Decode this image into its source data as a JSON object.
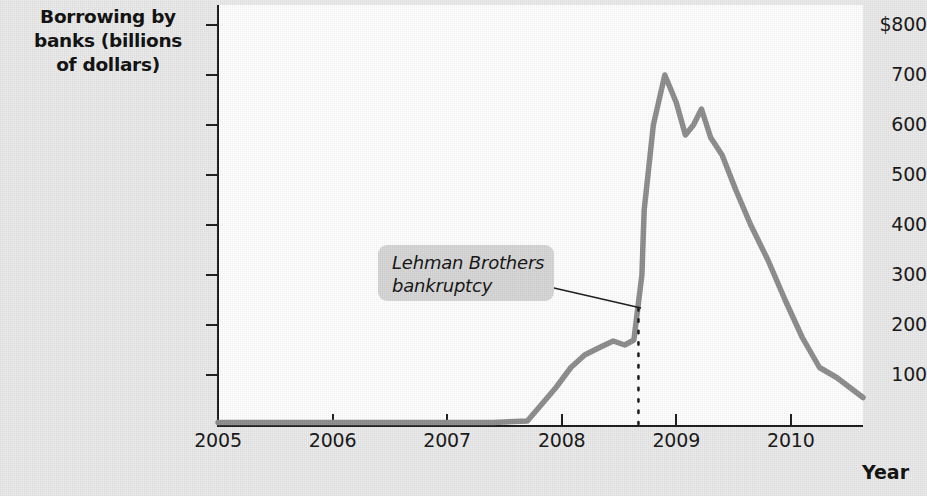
{
  "chart_data": {
    "type": "line",
    "title": "",
    "ylabel": "Borrowing by banks (billions of dollars)",
    "xlabel": "Year",
    "xlim": [
      2005.0,
      2010.63
    ],
    "ylim": [
      0,
      840
    ],
    "grid": false,
    "legend": null,
    "y_ticks": [
      {
        "value": 800,
        "label": "$800"
      },
      {
        "value": 700,
        "label": "700"
      },
      {
        "value": 600,
        "label": "600"
      },
      {
        "value": 500,
        "label": "500"
      },
      {
        "value": 400,
        "label": "400"
      },
      {
        "value": 300,
        "label": "300"
      },
      {
        "value": 200,
        "label": "200"
      },
      {
        "value": 100,
        "label": "100"
      }
    ],
    "x_ticks": [
      {
        "value": 2005,
        "label": "2005"
      },
      {
        "value": 2006,
        "label": "2006"
      },
      {
        "value": 2007,
        "label": "2007"
      },
      {
        "value": 2008,
        "label": "2008"
      },
      {
        "value": 2009,
        "label": "2009"
      },
      {
        "value": 2010,
        "label": "2010"
      }
    ],
    "series": [
      {
        "name": "Borrowing by banks",
        "color": "#8c8c8c",
        "x": [
          2005.0,
          2005.4,
          2005.8,
          2006.2,
          2006.6,
          2007.0,
          2007.4,
          2007.7,
          2007.82,
          2007.95,
          2008.08,
          2008.2,
          2008.33,
          2008.45,
          2008.55,
          2008.63,
          2008.7,
          2008.72,
          2008.8,
          2008.9,
          2009.0,
          2009.08,
          2009.15,
          2009.22,
          2009.3,
          2009.4,
          2009.52,
          2009.65,
          2009.8,
          2009.95,
          2010.1,
          2010.25,
          2010.4,
          2010.63
        ],
        "y": [
          5,
          5,
          5,
          5,
          5,
          5,
          5,
          8,
          40,
          75,
          115,
          140,
          155,
          168,
          160,
          170,
          300,
          430,
          600,
          700,
          645,
          580,
          600,
          632,
          575,
          540,
          470,
          400,
          330,
          250,
          175,
          115,
          95,
          55
        ]
      }
    ],
    "annotations": [
      {
        "name": "lehman-brothers-bankruptcy",
        "text": "Lehman Brothers\nbankruptcy",
        "box": {
          "x": 378,
          "y": 245,
          "w": 176,
          "h": 56,
          "fill": "#d6d6d6"
        },
        "leader_line": {
          "x1": 554,
          "y1": 288,
          "x2": 641,
          "y2": 308,
          "color": "#1a1a1a"
        },
        "event_marker": {
          "style": "dotted-vertical",
          "x_value": 2008.67,
          "y_top": 308,
          "y_bottom": 424,
          "color": "#1a1a1a"
        }
      }
    ],
    "colors": {
      "line": "#8c8c8c",
      "axis": "#1a1a1a",
      "plot_background": "#ffffff",
      "page_background": "#e9e9e9",
      "annotation_box": "#d6d6d6",
      "text": "#111111"
    }
  }
}
